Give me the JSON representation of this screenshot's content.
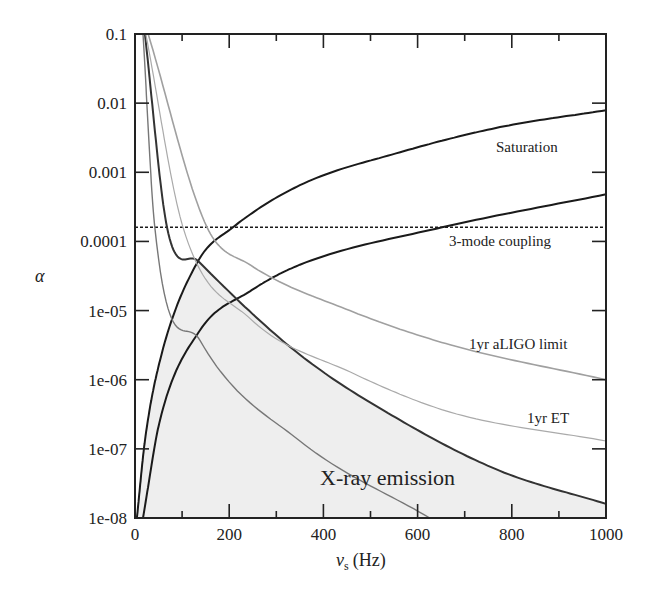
{
  "chart_data": {
    "type": "line",
    "title": "",
    "xlabel": "ν_s (Hz)",
    "xlabel_main": "ν",
    "xlabel_sub": "s",
    "xlabel_unit": "(Hz)",
    "ylabel": "α",
    "xscale": "linear",
    "yscale": "log",
    "xlim": [
      0,
      1000
    ],
    "ylim": [
      1e-08,
      0.1
    ],
    "grid": false,
    "x_ticks": [
      0,
      200,
      400,
      600,
      800,
      1000
    ],
    "x_tick_labels": [
      "0",
      "200",
      "400",
      "600",
      "800",
      "1000"
    ],
    "x_minor_ticks": [
      100,
      300,
      500,
      700,
      900
    ],
    "y_ticks": [
      0.1,
      0.01,
      0.001,
      0.0001,
      1e-05,
      1e-06,
      1e-07,
      1e-08
    ],
    "y_tick_labels": [
      "0.1",
      "0.01",
      "0.001",
      "0.0001",
      "1e-05",
      "1e-06",
      "1e-07",
      "1e-08"
    ],
    "series": [
      {
        "name": "Saturation (upper)",
        "color": "#1a1a1a",
        "width": 2.0,
        "style": "solid",
        "x": [
          4,
          21,
          53,
          134,
          208,
          350,
          563,
          775,
          1000
        ],
        "y": [
          1e-08,
          1.3e-07,
          1.9e-06,
          5.2e-05,
          0.00016,
          0.00065,
          0.00195,
          0.0045,
          0.0079
        ]
      },
      {
        "name": "Saturation (lower)",
        "color": "#1a1a1a",
        "width": 2.0,
        "style": "solid",
        "x": [
          17,
          53,
          138,
          244,
          350,
          652,
          1000
        ],
        "y": [
          1e-08,
          2.6e-07,
          5.2e-06,
          1.9e-05,
          4.6e-05,
          0.00016,
          0.00048
        ]
      },
      {
        "name": "3-mode coupling",
        "color": "#1a1a1a",
        "width": 1.4,
        "style": "dashed",
        "x": [
          0,
          1000
        ],
        "y": [
          0.00016,
          0.00016
        ]
      },
      {
        "name": "X-ray emission",
        "color": "#333333",
        "width": 2.0,
        "style": "solid",
        "x": [
          21,
          68,
          134,
          350,
          563,
          775,
          1000
        ],
        "y": [
          0.1,
          0.00016,
          5.2e-05,
          2.3e-06,
          2.6e-07,
          4.8e-08,
          1.6e-08
        ]
      },
      {
        "name": "Steep limit",
        "color": "#777777",
        "width": 1.4,
        "style": "solid",
        "x": [
          17,
          42,
          138,
          350,
          626
        ],
        "y": [
          0.1,
          0.00016,
          3.7e-06,
          1.3e-07,
          1e-08
        ]
      },
      {
        "name": "1yr ET",
        "color": "#aaaaaa",
        "width": 1.2,
        "style": "solid",
        "x": [
          23,
          102,
          244,
          456,
          669,
          1000
        ],
        "y": [
          0.1,
          0.00016,
          7.7e-06,
          1.3e-06,
          3.4e-07,
          1.3e-07
        ]
      },
      {
        "name": "1yr aLIGO limit",
        "color": "#a0a0a0",
        "width": 1.6,
        "style": "solid",
        "x": [
          28,
          153,
          244,
          456,
          669,
          1000
        ],
        "y": [
          0.1,
          0.00016,
          4.6e-05,
          1e-05,
          3.2e-06,
          1e-06
        ]
      }
    ],
    "shaded_region": {
      "name": "X-ray emission",
      "color": "#eeeeee",
      "bounded_by": [
        "Saturation (upper)",
        "X-ray emission"
      ]
    },
    "annotations": [
      {
        "text": "Saturation",
        "x": 840,
        "y": 0.0017
      },
      {
        "text": "3-mode coupling",
        "x": 830,
        "y": 9e-05
      },
      {
        "text": "1yr aLIGO limit",
        "x": 830,
        "y": 1.8e-06
      },
      {
        "text": "1yr ET",
        "x": 895,
        "y": 2.3e-07
      },
      {
        "text": "X-ray emission",
        "x": 460,
        "y": 2.8e-08
      }
    ]
  },
  "labels": {
    "saturation": "Saturation",
    "coupling": "3-mode coupling",
    "aligo": "1yr aLIGO limit",
    "et": "1yr ET",
    "xray": "X-ray emission",
    "ylabel": "α",
    "xlabel_main": "ν",
    "xlabel_sub": "s",
    "xlabel_unit": "(Hz)"
  }
}
